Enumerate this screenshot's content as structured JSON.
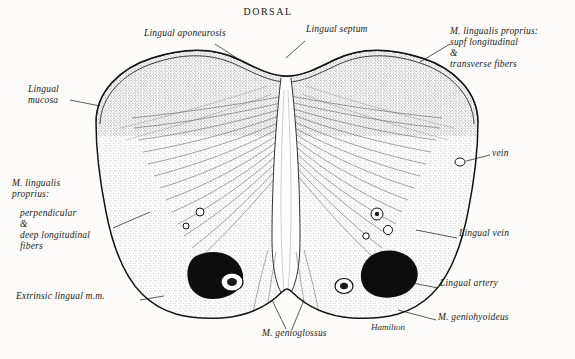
{
  "figure": {
    "type": "anatomical-illustration",
    "orientation_label": "DORSAL",
    "signature": "Hamilton",
    "background_color": "#fdfcfa",
    "ink_color": "#151515"
  },
  "labels": [
    {
      "id": "dorsal",
      "text": "DORSAL",
      "x": 268,
      "y": 8,
      "align": "center"
    },
    {
      "id": "lingual-aponeurosis",
      "text": "Lingual aponeurosis",
      "x": 144,
      "y": 34,
      "align": "left"
    },
    {
      "id": "lingual-septum",
      "text": "Lingual septum",
      "x": 306,
      "y": 30,
      "align": "left"
    },
    {
      "id": "m-lingualis-proprius-superior",
      "text": "M. lingualis proprius:\nsupf longitudinal\n&\ntransverse fibers",
      "x": 452,
      "y": 33,
      "align": "left"
    },
    {
      "id": "lingual-mucosa",
      "text": "Lingual\nmucosa",
      "x": 28,
      "y": 90,
      "align": "left"
    },
    {
      "id": "vein",
      "text": "vein",
      "x": 492,
      "y": 152,
      "align": "left"
    },
    {
      "id": "m-lingualis-proprius-lower",
      "text": "M. lingualis\nproprius:",
      "x": 12,
      "y": 182,
      "align": "left"
    },
    {
      "id": "perpendicular-deep-longitudinal",
      "text": "perpendicular\n&\ndeep longitudinal\nfibers",
      "x": 20,
      "y": 212,
      "align": "left"
    },
    {
      "id": "lingual-vein",
      "text": "Lingual vein",
      "x": 459,
      "y": 233,
      "align": "left"
    },
    {
      "id": "lingual-artery",
      "text": "Lingual artery",
      "x": 440,
      "y": 283,
      "align": "left"
    },
    {
      "id": "extrinsic-lingual-mm",
      "text": "Extrinsic lingual m.m.",
      "x": 16,
      "y": 296,
      "align": "left"
    },
    {
      "id": "m-genioglossus",
      "text": "M. genioglossus",
      "x": 262,
      "y": 333,
      "align": "left"
    },
    {
      "id": "m-geniohyoideus",
      "text": "M. geniohyoideus",
      "x": 438,
      "y": 317,
      "align": "left"
    },
    {
      "id": "hamilton-signature",
      "text": "Hamilton",
      "x": 371,
      "y": 327,
      "align": "left"
    }
  ],
  "leader_lines": [
    {
      "id": "leader-lingual-aponeurosis",
      "from": [
        215,
        44
      ],
      "to": [
        243,
        62
      ]
    },
    {
      "id": "leader-lingual-septum",
      "from": [
        305,
        41
      ],
      "to": [
        284,
        58
      ]
    },
    {
      "id": "leader-m-lingualis-superior",
      "from": [
        450,
        44
      ],
      "to": [
        420,
        62
      ]
    },
    {
      "id": "leader-lingual-mucosa",
      "from": [
        70,
        100
      ],
      "to": [
        100,
        104
      ]
    },
    {
      "id": "leader-vein",
      "from": [
        490,
        155
      ],
      "to": [
        466,
        160
      ]
    },
    {
      "id": "leader-perpendicular",
      "from": [
        113,
        228
      ],
      "to": [
        147,
        210
      ]
    },
    {
      "id": "leader-lingual-vein",
      "from": [
        457,
        238
      ],
      "to": [
        418,
        230
      ]
    },
    {
      "id": "leader-lingual-artery",
      "from": [
        438,
        288
      ],
      "to": [
        382,
        277
      ]
    },
    {
      "id": "leader-extrinsic",
      "from": [
        140,
        300
      ],
      "to": [
        163,
        296
      ]
    },
    {
      "id": "leader-genioglossus-left",
      "from": [
        286,
        329
      ],
      "to": [
        272,
        300
      ]
    },
    {
      "id": "leader-genioglossus-right",
      "from": [
        292,
        329
      ],
      "to": [
        303,
        300
      ]
    },
    {
      "id": "leader-geniohyoideus",
      "from": [
        436,
        320
      ],
      "to": [
        398,
        311
      ]
    }
  ]
}
